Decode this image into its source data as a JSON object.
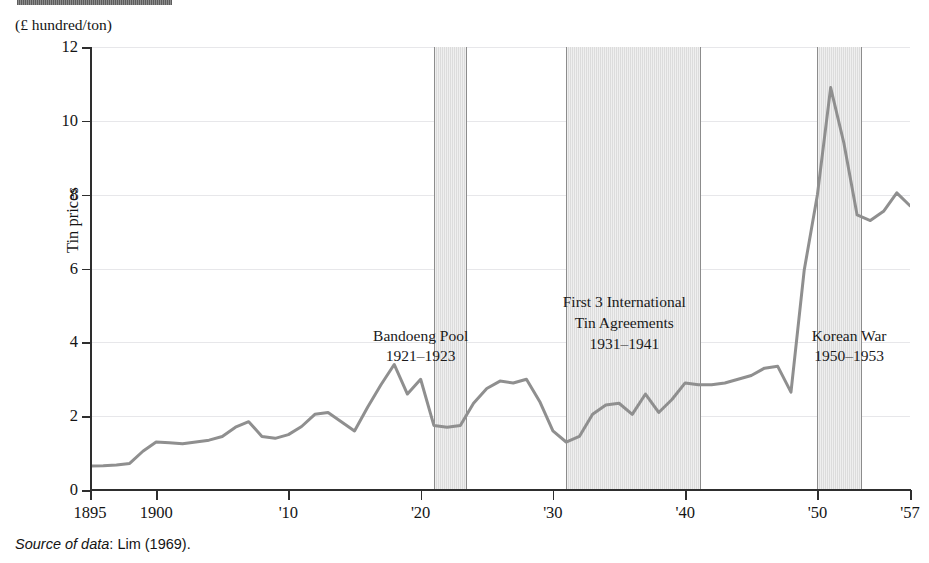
{
  "unit_label": "(£ hundred/ton)",
  "source_note": {
    "emphasis": "Source of data",
    "rest": ": Lim (1969)."
  },
  "annotations": [
    {
      "name": "bandoeng-pool",
      "line1": "Bandoeng Pool",
      "line2": "1921–1923",
      "x_year": 1920.0,
      "y_value": 4.45
    },
    {
      "name": "tin-agreements",
      "line1": "First 3 International",
      "line2": "Tin Agreements",
      "line3": "1931–1941",
      "x_year": 1935.4,
      "y_value": 5.35
    },
    {
      "name": "korean-war",
      "line1": "Korean War",
      "line2": "1950–1953",
      "x_year": 1952.4,
      "y_value": 4.45
    }
  ],
  "chart_data": {
    "type": "line",
    "title": "",
    "xlabel": "",
    "ylabel": "Tin prices",
    "unit": "£ hundred/ton",
    "xlim": [
      1895,
      1957
    ],
    "ylim": [
      0,
      12
    ],
    "xticks": [
      1895,
      1900,
      1910,
      1920,
      1930,
      1940,
      1950,
      1957
    ],
    "xticklabels": [
      "1895",
      "1900",
      "'10",
      "'20",
      "'30",
      "'40",
      "'50",
      "'57"
    ],
    "yticks": [
      0,
      2,
      4,
      6,
      8,
      10,
      12
    ],
    "yticklabels": [
      "0",
      "2",
      "4",
      "6",
      "8",
      "10",
      "12"
    ],
    "grid": "horizontal",
    "legend": "none",
    "line_color": "#8f8f8f",
    "band_color": "#dcdcdc",
    "shaded_bands": [
      {
        "label": "Bandoeng Pool",
        "start": 1921,
        "end": 1923.5
      },
      {
        "label": "First 3 International Tin Agreements",
        "start": 1931,
        "end": 1941.2
      },
      {
        "label": "Korean War",
        "start": 1950,
        "end": 1953.4
      }
    ],
    "x": [
      1895,
      1896,
      1897,
      1898,
      1899,
      1900,
      1901,
      1902,
      1903,
      1904,
      1905,
      1906,
      1907,
      1908,
      1909,
      1910,
      1911,
      1912,
      1913,
      1914,
      1915,
      1916,
      1917,
      1918,
      1919,
      1920,
      1921,
      1922,
      1923,
      1924,
      1925,
      1926,
      1927,
      1928,
      1929,
      1930,
      1931,
      1932,
      1933,
      1934,
      1935,
      1936,
      1937,
      1938,
      1939,
      1940,
      1941,
      1942,
      1943,
      1944,
      1945,
      1946,
      1947,
      1948,
      1949,
      1950,
      1951,
      1952,
      1953,
      1954,
      1955,
      1956,
      1957
    ],
    "y": [
      0.65,
      0.66,
      0.68,
      0.72,
      1.05,
      1.3,
      1.28,
      1.25,
      1.3,
      1.35,
      1.45,
      1.7,
      1.85,
      1.45,
      1.4,
      1.5,
      1.72,
      2.05,
      2.1,
      1.85,
      1.6,
      2.25,
      2.85,
      3.4,
      2.6,
      3.0,
      1.75,
      1.7,
      1.75,
      2.35,
      2.75,
      2.95,
      2.9,
      3.0,
      2.4,
      1.6,
      1.3,
      1.45,
      2.05,
      2.3,
      2.35,
      2.05,
      2.6,
      2.1,
      2.45,
      2.9,
      2.85,
      2.85,
      2.9,
      3.0,
      3.1,
      3.3,
      3.35,
      2.65,
      5.95,
      8.0,
      10.9,
      9.4,
      7.45,
      7.3,
      7.55,
      8.05,
      7.7
    ]
  }
}
